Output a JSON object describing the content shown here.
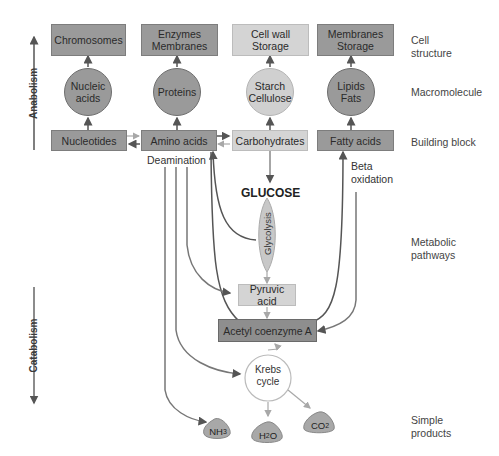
{
  "axis": {
    "anabolism": "Anabolism",
    "catabolism": "Catabolism"
  },
  "row_labels": {
    "cell_structure": "Cell\nstructure",
    "macromolecule": "Macromolecule",
    "building_block": "Building block",
    "metabolic_pathways": "Metabolic\npathways",
    "simple_products": "Simple\nproducts"
  },
  "cell_structures": [
    {
      "label": "Chromosomes",
      "shade": "dark"
    },
    {
      "label": "Enzymes Membranes",
      "shade": "dark"
    },
    {
      "label": "Cell wall Storage",
      "shade": "light"
    },
    {
      "label": "Membranes Storage",
      "shade": "dark"
    }
  ],
  "macromolecules": [
    {
      "label": "Nucleic acids",
      "shade": "dark"
    },
    {
      "label": "Proteins",
      "shade": "dark"
    },
    {
      "label": "Starch Cellulose",
      "shade": "light"
    },
    {
      "label": "Lipids Fats",
      "shade": "dark"
    }
  ],
  "building_blocks": [
    {
      "label": "Nucleotides",
      "shade": "dark"
    },
    {
      "label": "Amino acids",
      "shade": "dark"
    },
    {
      "label": "Carbohydrates",
      "shade": "light"
    },
    {
      "label": "Fatty acids",
      "shade": "dark"
    }
  ],
  "annotations": {
    "deamination": "Deamination",
    "beta_oxidation": "Beta\noxidation",
    "glucose": "GLUCOSE",
    "glycolysis": "Glycolysis"
  },
  "pathway": {
    "pyruvic_acid": "Pyruvic acid",
    "acetyl_coa": "Acetyl coenzyme A",
    "krebs_cycle": "Krebs\ncycle"
  },
  "products": [
    {
      "base": "NH",
      "sub": "3"
    },
    {
      "base": "H",
      "sub": "2",
      "tail": "O"
    },
    {
      "base": "CO",
      "sub": "2"
    }
  ],
  "colors": {
    "dark_fill": "#9a9a9a",
    "light_fill": "#d4d4d4",
    "dark_arrow": "#555555",
    "light_arrow": "#a8a8a8"
  }
}
